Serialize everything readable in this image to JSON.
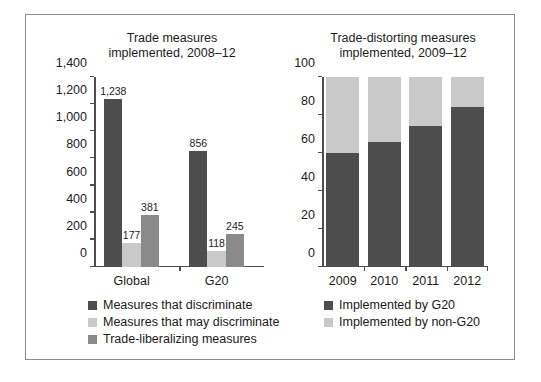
{
  "colors": {
    "dark_gray": "#4d4d4d",
    "light_gray": "#c9c9c9",
    "medium_gray": "#8a8a8a",
    "axis": "#4d4d4d",
    "frame": "#8c8c8c",
    "text": "#1c1c1c"
  },
  "chart_data": [
    {
      "type": "bar",
      "id": "trade-measures",
      "title": "Trade measures implemented, 2008–12",
      "title_line1": "Trade measures",
      "title_line2": "implemented, 2008–12",
      "xlabel": "",
      "ylabel": "",
      "ylim": [
        0,
        1400
      ],
      "yticks": [
        0,
        200,
        400,
        600,
        800,
        1000,
        1200,
        1400
      ],
      "ytick_labels": [
        "0",
        "200",
        "400",
        "600",
        "800",
        "1,000",
        "1,200",
        "1,400"
      ],
      "grid": false,
      "legend_position": "below",
      "categories": [
        "Global",
        "G20"
      ],
      "series": [
        {
          "name": "Measures that discriminate",
          "color": "#4d4d4d",
          "values": [
            1238,
            856
          ],
          "value_labels": [
            "1,238",
            "856"
          ]
        },
        {
          "name": "Measures that may discriminate",
          "color": "#c9c9c9",
          "values": [
            177,
            118
          ],
          "value_labels": [
            "177",
            "118"
          ]
        },
        {
          "name": "Trade-liberalizing measures",
          "color": "#8a8a8a",
          "values": [
            381,
            245
          ],
          "value_labels": [
            "381",
            "245"
          ]
        }
      ]
    },
    {
      "type": "bar",
      "id": "trade-distorting-measures",
      "subtype": "stacked-100",
      "title": "Trade-distorting measures implemented, 2009–12",
      "title_line1": "Trade-distorting measures",
      "title_line2": "implemented, 2009–12",
      "xlabel": "",
      "ylabel": "",
      "ylim": [
        0,
        100
      ],
      "yticks": [
        0,
        20,
        40,
        60,
        80,
        100
      ],
      "ytick_labels": [
        "0",
        "20",
        "40",
        "60",
        "80",
        "100"
      ],
      "grid": false,
      "legend_position": "below",
      "categories": [
        "2009",
        "2010",
        "2011",
        "2012"
      ],
      "series": [
        {
          "name": "Implemented by G20",
          "color": "#4d4d4d",
          "values": [
            60,
            66,
            74,
            84
          ]
        },
        {
          "name": "Implemented by non-G20",
          "color": "#c9c9c9",
          "values": [
            40,
            34,
            26,
            16
          ]
        }
      ]
    }
  ]
}
